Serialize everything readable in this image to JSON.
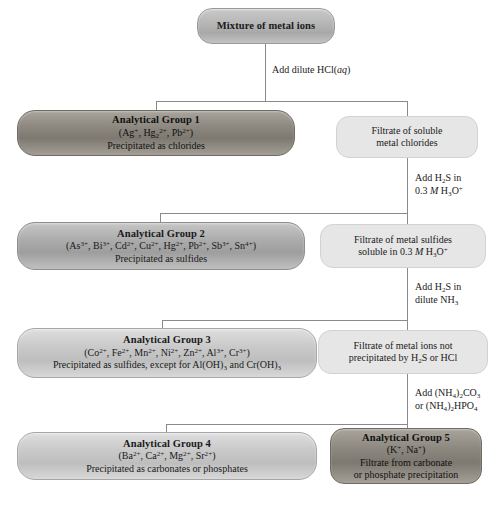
{
  "diagram": {
    "colors": {
      "dark_box": "#8d8880",
      "medium_box": "#ababab",
      "light_box": "#c9c9c9",
      "pale_box": "#e6e6e6",
      "line": "#8a8a8a",
      "background": "#ffffff"
    }
  },
  "nodes": {
    "mixture": {
      "title": "Mixture of metal ions"
    },
    "group1": {
      "title": "Analytical Group 1",
      "ions": "(Ag+, Hg2 2+, Pb2+)",
      "desc": "Precipitated as chlorides"
    },
    "group2": {
      "title": "Analytical Group 2",
      "ions": "(As3+, Bi3+, Cd2+, Cu2+, Hg2+, Pb2+, Sb3+, Sn4+)",
      "desc": "Precipitated as sulfides"
    },
    "group3": {
      "title": "Analytical Group 3",
      "ions": "(Co2+, Fe2+, Mn2+, Ni2+, Zn2+, Al3+, Cr3+)",
      "desc": "Precipitated as sulfides, except for Al(OH)3 and Cr(OH)3"
    },
    "group4": {
      "title": "Analytical Group 4",
      "ions": "(Ba2+, Ca2+, Mg2+, Sr2+)",
      "desc": "Precipitated as carbonates or phosphates"
    },
    "group5": {
      "title": "Analytical Group 5",
      "ions": "(K+, Na+)",
      "desc": "Filtrate from carbonate or phosphate precipitation"
    },
    "filtrate1": {
      "desc": "Filtrate of soluble metal chlorides"
    },
    "filtrate2": {
      "desc": "Filtrate of metal sulfides soluble in 0.3 M H3O+"
    },
    "filtrate3": {
      "desc": "Filtrate of metal ions not precipitated by H2S or HCl"
    }
  },
  "steps": {
    "step1": "Add dilute HCl(aq)",
    "step2": "Add H2S in 0.3 M H3O+",
    "step3": "Add H2S in dilute NH3",
    "step4": "Add (NH4)2CO3 or (NH4)2HPO4"
  }
}
